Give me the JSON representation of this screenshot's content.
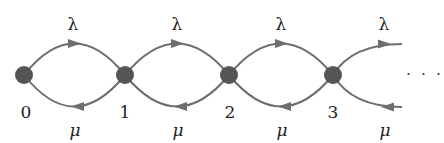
{
  "diagram": {
    "type": "birth-death-chain",
    "colors": {
      "edge": "#6e6e6e",
      "node": "#555555",
      "text": "#222222"
    },
    "nodes": [
      {
        "id": "0",
        "label": "0",
        "x": 24,
        "y": 75
      },
      {
        "id": "1",
        "label": "1",
        "x": 125,
        "y": 75
      },
      {
        "id": "2",
        "label": "2",
        "x": 229,
        "y": 75
      },
      {
        "id": "3",
        "label": "3",
        "x": 333,
        "y": 75
      }
    ],
    "forward_label": "λ",
    "backward_label": "μ",
    "edges": [
      {
        "from": "0",
        "to": "1",
        "label": "λ"
      },
      {
        "from": "1",
        "to": "0",
        "label": "μ"
      },
      {
        "from": "1",
        "to": "2",
        "label": "λ"
      },
      {
        "from": "2",
        "to": "1",
        "label": "μ"
      },
      {
        "from": "2",
        "to": "3",
        "label": "λ"
      },
      {
        "from": "3",
        "to": "2",
        "label": "μ"
      },
      {
        "from": "3",
        "to": "…",
        "label": "λ"
      },
      {
        "from": "…",
        "to": "3",
        "label": "μ"
      }
    ],
    "labels": {
      "lambda": [
        "λ",
        "λ",
        "λ",
        "λ"
      ],
      "mu": [
        "μ",
        "μ",
        "μ",
        "μ"
      ],
      "states": [
        "0",
        "1",
        "2",
        "3"
      ],
      "continuation": "· · ·"
    }
  }
}
